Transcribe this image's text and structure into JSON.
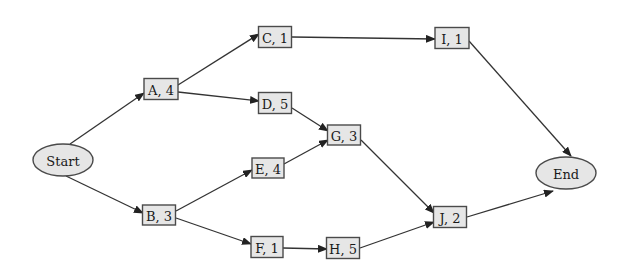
{
  "diagram": {
    "type": "activity-on-node network",
    "nodes": [
      {
        "id": "Start",
        "label": "Start",
        "shape": "ellipse"
      },
      {
        "id": "A",
        "label": "A, 4",
        "activity": "A",
        "duration": 4,
        "shape": "box"
      },
      {
        "id": "B",
        "label": "B, 3",
        "activity": "B",
        "duration": 3,
        "shape": "box"
      },
      {
        "id": "C",
        "label": "C, 1",
        "activity": "C",
        "duration": 1,
        "shape": "box"
      },
      {
        "id": "D",
        "label": "D, 5",
        "activity": "D",
        "duration": 5,
        "shape": "box"
      },
      {
        "id": "E",
        "label": "E, 4",
        "activity": "E",
        "duration": 4,
        "shape": "box"
      },
      {
        "id": "F",
        "label": "F, 1",
        "activity": "F",
        "duration": 1,
        "shape": "box"
      },
      {
        "id": "G",
        "label": "G, 3",
        "activity": "G",
        "duration": 3,
        "shape": "box"
      },
      {
        "id": "H",
        "label": "H, 5",
        "activity": "H",
        "duration": 5,
        "shape": "box"
      },
      {
        "id": "I",
        "label": "I, 1",
        "activity": "I",
        "duration": 1,
        "shape": "box"
      },
      {
        "id": "J",
        "label": "J, 2",
        "activity": "J",
        "duration": 2,
        "shape": "box"
      },
      {
        "id": "End",
        "label": "End",
        "shape": "ellipse"
      }
    ],
    "edges": [
      {
        "from": "Start",
        "to": "A"
      },
      {
        "from": "Start",
        "to": "B"
      },
      {
        "from": "A",
        "to": "C"
      },
      {
        "from": "A",
        "to": "D"
      },
      {
        "from": "B",
        "to": "E"
      },
      {
        "from": "B",
        "to": "F"
      },
      {
        "from": "C",
        "to": "I"
      },
      {
        "from": "D",
        "to": "G"
      },
      {
        "from": "E",
        "to": "G"
      },
      {
        "from": "F",
        "to": "H"
      },
      {
        "from": "G",
        "to": "J"
      },
      {
        "from": "H",
        "to": "J"
      },
      {
        "from": "I",
        "to": "End"
      },
      {
        "from": "J",
        "to": "End"
      }
    ]
  }
}
